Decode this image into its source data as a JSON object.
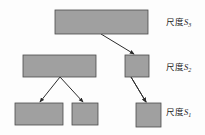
{
  "figure": {
    "type": "hierarchical-tree-diagram",
    "background_color": "#fdfdfd",
    "node_fill_color": "#a0a0a0",
    "node_stroke_color": "#4a4a4a",
    "arrow_color": "#2b2b2b"
  },
  "labels": {
    "s3": {
      "text": "尺度",
      "symbol": "S",
      "subscript": "3"
    },
    "s2": {
      "text": "尺度",
      "symbol": "S",
      "subscript": "2"
    },
    "s1": {
      "text": "尺度",
      "symbol": "S",
      "subscript": "1"
    }
  },
  "nodes": [
    {
      "id": "n3-1",
      "level": "s3",
      "x": 55,
      "y": 10,
      "w": 93,
      "h": 24
    },
    {
      "id": "n2-1",
      "level": "s2",
      "x": 23,
      "y": 55,
      "w": 73,
      "h": 22
    },
    {
      "id": "n2-2",
      "level": "s2",
      "x": 125,
      "y": 55,
      "w": 24,
      "h": 22
    },
    {
      "id": "n1-1",
      "level": "s1",
      "x": 15,
      "y": 103,
      "w": 48,
      "h": 22
    },
    {
      "id": "n1-2",
      "level": "s1",
      "x": 72,
      "y": 103,
      "w": 26,
      "h": 22
    },
    {
      "id": "n1-3",
      "level": "s1",
      "x": 136,
      "y": 103,
      "w": 25,
      "h": 24
    }
  ],
  "edges": [
    {
      "from": "n3-1",
      "to": "n2-1",
      "x1": 101,
      "y1": 34,
      "x2": 67,
      "y2": 54
    },
    {
      "from": "n3-1",
      "to": "n2-2",
      "x1": 101,
      "y1": 34,
      "x2": 134,
      "y2": 54
    },
    {
      "from": "n2-1",
      "to": "n1-1",
      "x1": 60,
      "y1": 77,
      "x2": 40,
      "y2": 102
    },
    {
      "from": "n2-1",
      "to": "n1-2",
      "x1": 60,
      "y1": 77,
      "x2": 83,
      "y2": 102
    },
    {
      "from": "n2-2",
      "to": "n1-3",
      "x1": 131,
      "y1": 77,
      "x2": 146,
      "y2": 102
    }
  ]
}
